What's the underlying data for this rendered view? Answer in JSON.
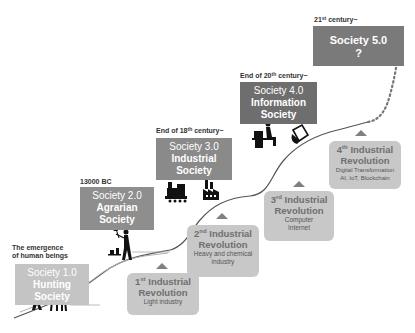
{
  "colors": {
    "society1": "#c4c4c4",
    "society2": "#8e8e8e",
    "society3": "#8a8a8a",
    "society4": "#6e6e6e",
    "society5": "#7a7a7a",
    "revolution_box": "#c8c8c8",
    "curve": "#555555",
    "triangle": "#808080"
  },
  "societies": [
    {
      "era": "The emergence of human beings",
      "era_line1": "The emergence",
      "era_line2": "of human beings",
      "number": "Society 1.0",
      "name_line1": "Hunting",
      "name_line2": "Society",
      "icon": "hunter-and-deer-icon"
    },
    {
      "era": "13000 BC",
      "number": "Society 2.0",
      "name_line1": "Agrarian",
      "name_line2": "Society",
      "icon": "farmer-icon"
    },
    {
      "era_prefix": "End of 18",
      "era_sup": "th",
      "era_suffix": " century~",
      "number": "Society 3.0",
      "name_line1": "Industrial",
      "name_line2": "Society",
      "icon": "train-factory-icon"
    },
    {
      "era_prefix": "End of 20",
      "era_sup": "th",
      "era_suffix": " century~",
      "number": "Society 4.0",
      "name_line1": "Information",
      "name_line2": "Society",
      "icon": "computer-user-icon"
    },
    {
      "era_prefix": "21",
      "era_sup": "st",
      "era_suffix": " century~",
      "number": "Society 5.0",
      "name_line1": "?",
      "name_line2": "",
      "icon": ""
    }
  ],
  "revolutions": [
    {
      "ordinal": "1",
      "sup": "st",
      "title_rest": " Industrial",
      "line2": "Revolution",
      "desc1": "Light industry",
      "desc2": ""
    },
    {
      "ordinal": "2",
      "sup": "nd",
      "title_rest": " Industrial",
      "line2": "Revolution",
      "desc1": "Heavy and chemical",
      "desc2": "industry"
    },
    {
      "ordinal": "3",
      "sup": "rd",
      "title_rest": " Industrial",
      "line2": "Revolution",
      "desc1": "Computer",
      "desc2": "Internet"
    },
    {
      "ordinal": "4",
      "sup": "th",
      "title_rest": " Industrial",
      "line2": "Revolution",
      "desc1": "Digital Transformation",
      "desc2": "AI, IoT, Blockchain"
    }
  ]
}
